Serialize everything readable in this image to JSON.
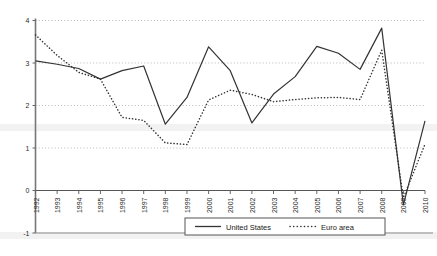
{
  "chart_data": {
    "type": "line",
    "title": "",
    "subtitle": "",
    "xlabel": "",
    "ylabel": "",
    "x": [
      1992,
      1993,
      1994,
      1995,
      1996,
      1997,
      1998,
      1999,
      2000,
      2001,
      2002,
      2003,
      2004,
      2005,
      2006,
      2007,
      2008,
      2009,
      2010
    ],
    "categories": [
      "1992",
      "1993",
      "1994",
      "1995",
      "1996",
      "1997",
      "1998",
      "1999",
      "2000",
      "2001",
      "2002",
      "2003",
      "2004",
      "2005",
      "2006",
      "2007",
      "2008",
      "2009",
      "2010"
    ],
    "series": [
      {
        "name": "United States",
        "style": "solid",
        "color": "#333333",
        "values": [
          3.05,
          2.97,
          2.87,
          2.62,
          2.82,
          2.93,
          1.56,
          2.19,
          3.38,
          2.82,
          1.59,
          2.27,
          2.68,
          3.39,
          3.23,
          2.85,
          3.82,
          -0.34,
          1.64
        ]
      },
      {
        "name": "Euro area",
        "style": "dotted",
        "color": "#333333",
        "values": [
          3.66,
          3.18,
          2.78,
          2.62,
          1.72,
          1.65,
          1.12,
          1.08,
          2.13,
          2.36,
          2.26,
          2.09,
          2.14,
          2.18,
          2.19,
          2.14,
          3.3,
          -0.17,
          1.09
        ]
      }
    ],
    "ylim": [
      -1,
      4
    ],
    "yticks": [
      "4",
      "3",
      "2",
      "1",
      "0",
      "-1"
    ],
    "ytick_values": [
      4,
      3,
      2,
      1,
      0,
      -1
    ],
    "xlim": [
      1992,
      2010
    ],
    "grid": "horizontal-dotted",
    "legend_position": "bottom-center",
    "legend": [
      {
        "label": "United States",
        "style": "solid"
      },
      {
        "label": "Euro area",
        "style": "dotted"
      }
    ]
  }
}
